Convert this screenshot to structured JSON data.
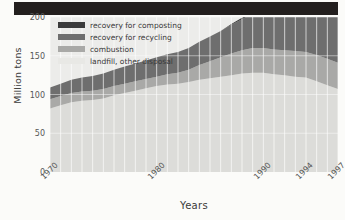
{
  "figure": {
    "ylabel": "Million tons",
    "xlabel": "Years"
  },
  "legend": {
    "items": [
      {
        "label": "recovery for composting",
        "color": "#3b3b3b"
      },
      {
        "label": "recovery for recycling",
        "color": "#6e6e6e"
      },
      {
        "label": "combustion",
        "color": "#a9a9a7"
      },
      {
        "label": "landfill, other disposal",
        "color": "#dcdcd9"
      }
    ]
  },
  "axes": {
    "y_ticks": [
      "0",
      "50",
      "100",
      "150",
      "200"
    ],
    "x_ticks": [
      "1970",
      "1980",
      "1990",
      "1994",
      "1997"
    ]
  },
  "chart_data": {
    "type": "area",
    "title": "",
    "xlabel": "Years",
    "ylabel": "Million tons",
    "xlim": [
      1970,
      1997
    ],
    "ylim": [
      0,
      200
    ],
    "grid": "vertical white gridlines",
    "legend_position": "top-left inside plot",
    "stacked": true,
    "stack_order_bottom_to_top": [
      "landfill, other disposal",
      "combustion",
      "recovery for recycling",
      "recovery for composting"
    ],
    "x": [
      1970,
      1971,
      1972,
      1973,
      1974,
      1975,
      1976,
      1977,
      1978,
      1979,
      1980,
      1981,
      1982,
      1983,
      1984,
      1985,
      1986,
      1987,
      1988,
      1989,
      1990,
      1991,
      1992,
      1993,
      1994,
      1995,
      1996,
      1997
    ],
    "series": [
      {
        "name": "landfill, other disposal",
        "color": "#dcdcd9",
        "values": [
          82,
          86,
          90,
          92,
          93,
          95,
          99,
          102,
          105,
          108,
          111,
          113,
          114,
          116,
          119,
          121,
          123,
          125,
          127,
          128,
          128,
          126,
          125,
          123,
          122,
          117,
          112,
          107
        ]
      },
      {
        "name": "combustion",
        "color": "#a9a9a7",
        "values": [
          12,
          12,
          12,
          12,
          12,
          12,
          12,
          12,
          12,
          12,
          12,
          13,
          14,
          16,
          19,
          22,
          25,
          28,
          30,
          32,
          32,
          32,
          32,
          33,
          33,
          34,
          34,
          34
        ]
      },
      {
        "name": "recovery for recycling",
        "color": "#6e6e6e",
        "values": [
          15,
          16,
          17,
          18,
          19,
          20,
          21,
          22,
          23,
          24,
          25,
          26,
          27,
          28,
          30,
          32,
          34,
          37,
          40,
          44,
          48,
          51,
          54,
          56,
          58,
          60,
          61,
          62
        ]
      },
      {
        "name": "recovery for composting",
        "color": "#3b3b3b",
        "values": [
          0,
          0,
          0,
          0,
          0,
          0,
          0,
          0,
          0,
          0,
          0,
          0,
          0,
          0,
          0,
          0,
          0,
          1,
          2,
          3,
          4,
          5,
          6,
          7,
          8,
          9,
          11,
          13
        ]
      }
    ],
    "totals": [
      109,
      114,
      119,
      122,
      124,
      127,
      132,
      136,
      140,
      144,
      148,
      152,
      155,
      160,
      168,
      175,
      182,
      191,
      199,
      207,
      212,
      214,
      217,
      219,
      221,
      220,
      218,
      216
    ]
  }
}
